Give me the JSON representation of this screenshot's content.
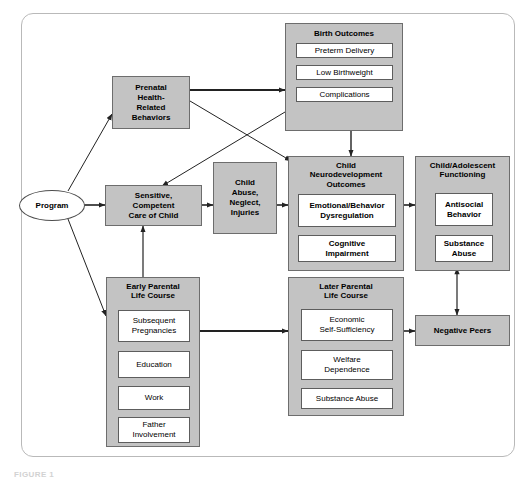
{
  "figure": {
    "title": "LOGIC MODEL FOR HOME VISITING INTERVENTIONS",
    "caption": "FIGURE 1"
  },
  "colors": {
    "group_fill": "#c3c3c3",
    "leaf_fill": "#ffffff",
    "border": "#6d6d6d",
    "frame": "#b9b9b9",
    "edge": "#222222"
  },
  "nodes": {
    "program": {
      "label": "Program",
      "shape": "oval"
    },
    "prenatal": {
      "label": "Prenatal\nHealth-\nRelated\nBehaviors",
      "lines": [
        "Prenatal",
        "Health-",
        "Related",
        "Behaviors"
      ]
    },
    "sensitive_care": {
      "lines": [
        "Sensitive,",
        "Competent",
        "Care of Child"
      ]
    },
    "child_abuse": {
      "lines": [
        "Child",
        "Abuse,",
        "Neglect,",
        "Injuries"
      ]
    },
    "negative_peers": {
      "label": "Negative Peers"
    }
  },
  "groups": {
    "birth_outcomes": {
      "title": "Birth Outcomes",
      "items": [
        {
          "label": "Preterm Delivery"
        },
        {
          "label": "Low Birthweight"
        },
        {
          "label": "Complications"
        }
      ]
    },
    "child_neuro": {
      "title": "Child\nNeurodevelopment\nOutcomes",
      "title_lines": [
        "Child",
        "Neurodevelopment",
        "Outcomes"
      ],
      "items": [
        {
          "lines": [
            "Emotional/Behavior",
            "Dysregulation"
          ]
        },
        {
          "lines": [
            "Cognitive",
            "Impairment"
          ]
        }
      ]
    },
    "child_adolescent": {
      "title_lines": [
        "Child/Adolescent",
        "Functioning"
      ],
      "items": [
        {
          "lines": [
            "Antisocial",
            "Behavior"
          ]
        },
        {
          "lines": [
            "Substance",
            "Abuse"
          ]
        }
      ]
    },
    "early_parental": {
      "title_lines": [
        "Early Parental",
        "Life Course"
      ],
      "items": [
        {
          "lines": [
            "Subsequent",
            "Pregnancies"
          ]
        },
        {
          "lines": [
            "Education"
          ]
        },
        {
          "lines": [
            "Work"
          ]
        },
        {
          "lines": [
            "Father",
            "Involvement"
          ]
        }
      ]
    },
    "later_parental": {
      "title_lines": [
        "Later Parental",
        "Life Course"
      ],
      "items": [
        {
          "lines": [
            "Economic",
            "Self-Sufficiency"
          ]
        },
        {
          "lines": [
            "Welfare",
            "Dependence"
          ]
        },
        {
          "lines": [
            "Substance Abuse"
          ]
        }
      ]
    }
  },
  "edges": [
    {
      "from": "program",
      "to": "prenatal",
      "type": "single"
    },
    {
      "from": "program",
      "to": "sensitive_care",
      "type": "single"
    },
    {
      "from": "program",
      "to": "early_parental",
      "type": "single"
    },
    {
      "from": "prenatal",
      "to": "birth_outcomes",
      "type": "single"
    },
    {
      "from": "prenatal",
      "to": "child_neuro",
      "type": "single"
    },
    {
      "from": "birth_outcomes",
      "to": "sensitive_care",
      "type": "single"
    },
    {
      "from": "birth_outcomes",
      "to": "child_neuro",
      "type": "single"
    },
    {
      "from": "sensitive_care",
      "to": "child_abuse",
      "type": "single"
    },
    {
      "from": "child_abuse",
      "to": "child_neuro",
      "type": "single"
    },
    {
      "from": "child_neuro",
      "to": "child_adolescent",
      "type": "single"
    },
    {
      "from": "early_parental",
      "to": "sensitive_care",
      "type": "single"
    },
    {
      "from": "early_parental",
      "to": "later_parental",
      "type": "single"
    },
    {
      "from": "later_parental",
      "to": "negative_peers",
      "type": "single"
    },
    {
      "from": "child_adolescent",
      "to": "negative_peers",
      "type": "double"
    }
  ]
}
